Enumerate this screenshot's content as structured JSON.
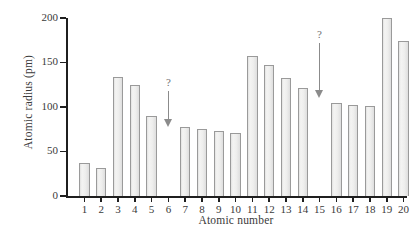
{
  "chart_data": {
    "type": "bar",
    "title": "",
    "xlabel": "Atomic number",
    "ylabel": "Atomic radius (pm)",
    "categories": [
      "1",
      "2",
      "3",
      "4",
      "5",
      "6",
      "7",
      "8",
      "9",
      "10",
      "11",
      "12",
      "13",
      "14",
      "15",
      "16",
      "17",
      "18",
      "19",
      "20"
    ],
    "values": [
      37,
      31,
      134,
      125,
      90,
      null,
      77,
      75,
      73,
      71,
      157,
      147,
      133,
      121,
      null,
      105,
      102,
      101,
      200,
      174
    ],
    "ylim": [
      0,
      200
    ],
    "xlim": [
      0.5,
      20.5
    ],
    "yticks": [
      0,
      50,
      100,
      150,
      200
    ],
    "ytick_labels": [
      "0",
      "50",
      "100",
      "150",
      "200"
    ],
    "grid": false,
    "legend": false,
    "bar_fill_color": "#ececeb",
    "bar_edge_color": "#9a9a9a",
    "axis_color": "#1f1f1f",
    "missing_categories": [
      "6",
      "15"
    ],
    "annotations": [
      {
        "label": "?",
        "category": "6",
        "arrow": "down",
        "tip_value": 77,
        "tail_value": 118
      },
      {
        "label": "?",
        "category": "15",
        "arrow": "down",
        "tip_value": 110,
        "tail_value": 172
      }
    ]
  }
}
